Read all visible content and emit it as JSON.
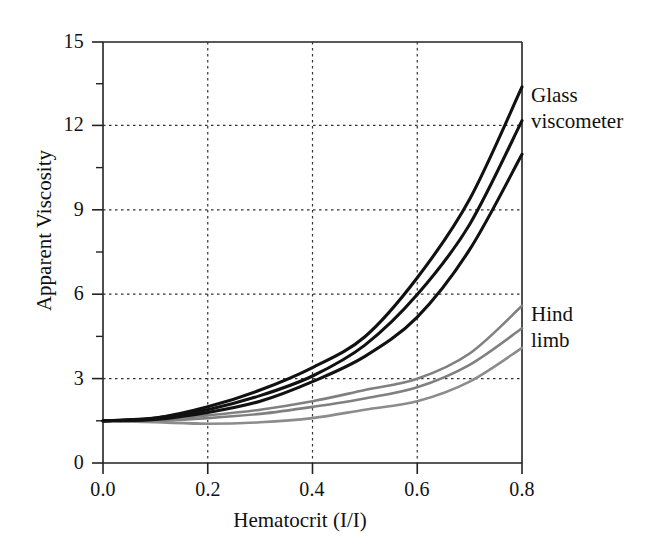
{
  "chart_data": {
    "type": "line",
    "title": "",
    "xlabel": "Hematocrit (I/I)",
    "ylabel": "Apparent Viscosity",
    "xlim": [
      0.0,
      0.8
    ],
    "ylim": [
      0,
      15
    ],
    "xticks": [
      "0.0",
      "0.2",
      "0.4",
      "0.6",
      "0.8"
    ],
    "xtick_values": [
      0.0,
      0.2,
      0.4,
      0.6,
      0.8
    ],
    "yticks": [
      "0",
      "3",
      "6",
      "9",
      "12",
      "15"
    ],
    "ytick_values": [
      0,
      3,
      6,
      9,
      12,
      15
    ],
    "y_minor_ticks": [
      1.5,
      4.5,
      7.5,
      10.5,
      13.5
    ],
    "grid": "dotted gridlines at x = 0.2, 0.4, 0.6 and y = 3, 6, 9, 12",
    "legend_position": "right of plot, inline annotations",
    "x": [
      0.0,
      0.1,
      0.2,
      0.3,
      0.4,
      0.5,
      0.6,
      0.7,
      0.8
    ],
    "series": [
      {
        "name": "Glass viscometer upper",
        "group": "Glass viscometer",
        "color": "#111111",
        "values": [
          1.5,
          1.6,
          2.0,
          2.6,
          3.4,
          4.5,
          6.6,
          9.4,
          13.4
        ]
      },
      {
        "name": "Glass viscometer middle",
        "group": "Glass viscometer",
        "color": "#111111",
        "values": [
          1.5,
          1.6,
          1.9,
          2.4,
          3.1,
          4.2,
          6.0,
          8.5,
          12.2
        ]
      },
      {
        "name": "Glass viscometer lower",
        "group": "Glass viscometer",
        "color": "#111111",
        "values": [
          1.5,
          1.55,
          1.8,
          2.2,
          2.9,
          3.8,
          5.2,
          7.6,
          11.0
        ]
      },
      {
        "name": "Hind limb upper",
        "group": "Hind limb",
        "color": "#808080",
        "values": [
          1.5,
          1.55,
          1.7,
          1.9,
          2.2,
          2.6,
          3.0,
          3.9,
          5.6
        ]
      },
      {
        "name": "Hind limb middle",
        "group": "Hind limb",
        "color": "#808080",
        "values": [
          1.5,
          1.5,
          1.6,
          1.75,
          2.0,
          2.3,
          2.7,
          3.5,
          4.8
        ]
      },
      {
        "name": "Hind limb lower",
        "group": "Hind limb",
        "color": "#8c8c8c",
        "values": [
          1.5,
          1.45,
          1.4,
          1.45,
          1.6,
          1.9,
          2.2,
          2.9,
          4.1
        ]
      }
    ],
    "annotations": [
      {
        "id": "glass",
        "lines": [
          "Glass",
          "viscometer"
        ],
        "x": 0.82,
        "y": 12.6
      },
      {
        "id": "hind",
        "lines": [
          "Hind",
          "limb"
        ],
        "x": 0.82,
        "y": 5.8
      }
    ]
  },
  "axis": {
    "x_title": "Hematocrit (I/I)",
    "y_title": "Apparent Viscosity"
  },
  "ticks": {
    "y": [
      "15",
      "12",
      "9",
      "6",
      "3",
      "0"
    ],
    "x": [
      "0.0",
      "0.2",
      "0.4",
      "0.6",
      "0.8"
    ]
  },
  "annotations": {
    "glass_line1": "Glass",
    "glass_line2": "viscometer",
    "hind_line1": "Hind",
    "hind_line2": "limb"
  },
  "colors": {
    "dark_series": "#111111",
    "gray_series": "#808080",
    "axis": "#222222",
    "grid": "#444444",
    "background": "#ffffff"
  }
}
